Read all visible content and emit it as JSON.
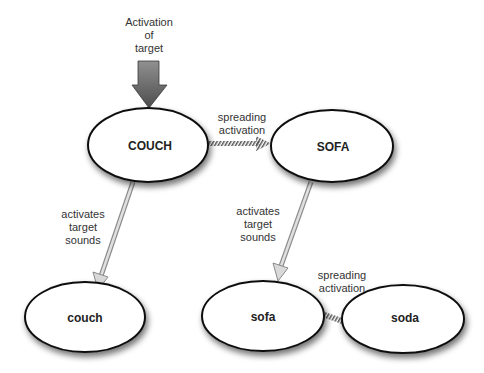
{
  "diagram": {
    "title_label": "Activation of target",
    "title_lines": [
      "Activation",
      "of",
      "target"
    ],
    "nodes": [
      {
        "id": "COUCH",
        "label": "COUCH"
      },
      {
        "id": "SOFA",
        "label": "SOFA"
      },
      {
        "id": "couch",
        "label": "couch"
      },
      {
        "id": "sofa",
        "label": "sofa"
      },
      {
        "id": "soda",
        "label": "soda"
      }
    ],
    "edges": [
      {
        "from": "COUCH",
        "to": "SOFA",
        "type": "hatched",
        "label_lines": [
          "spreading",
          "activation"
        ]
      },
      {
        "from": "COUCH",
        "to": "couch",
        "type": "hollow",
        "label_lines": [
          "activates",
          "target",
          "sounds"
        ]
      },
      {
        "from": "SOFA",
        "to": "sofa",
        "type": "hollow",
        "label_lines": [
          "activates",
          "target",
          "sounds"
        ]
      },
      {
        "from": "sofa",
        "to": "soda",
        "type": "hatched",
        "label_lines": [
          "spreading",
          "activation"
        ]
      }
    ],
    "colors": {
      "target_arrow_top": "#8a8a8a",
      "target_arrow_bottom": "#555555",
      "node_stroke": "#111111",
      "node_fill": "#ffffff",
      "hollow_arrow": "#bdbdbd",
      "hatch": "#555555"
    }
  }
}
